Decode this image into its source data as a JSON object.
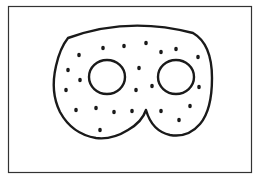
{
  "illustration": {
    "subject": "mask",
    "stroke_color": "#1a1a1a",
    "frame_color": "#333333",
    "background": "#ffffff",
    "dots": [
      [
        79,
        55
      ],
      [
        103,
        48
      ],
      [
        124,
        46
      ],
      [
        146,
        43
      ],
      [
        161,
        52
      ],
      [
        176,
        49
      ],
      [
        198,
        57
      ],
      [
        68,
        70
      ],
      [
        80,
        80
      ],
      [
        139,
        68
      ],
      [
        66,
        90
      ],
      [
        136,
        90
      ],
      [
        152,
        86
      ],
      [
        199,
        87
      ],
      [
        76,
        110
      ],
      [
        96,
        108
      ],
      [
        114,
        112
      ],
      [
        132,
        111
      ],
      [
        161,
        111
      ],
      [
        190,
        106
      ],
      [
        179,
        120
      ],
      [
        100,
        130
      ]
    ]
  }
}
